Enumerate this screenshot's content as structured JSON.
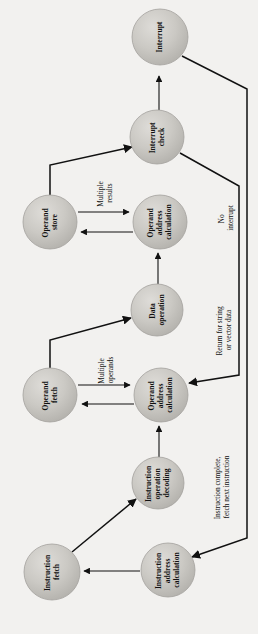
{
  "diagram": {
    "orientation": "rotated-90-ccw",
    "background_color": "#f2f1ef",
    "node_fill": "#c9c7c2",
    "node_stroke": "#9a9894",
    "line_color": "#111111",
    "nodes": [
      {
        "id": "interrupt",
        "label": "Interrupt",
        "cx": 160,
        "cy": 37,
        "r": 28
      },
      {
        "id": "interrupt-check",
        "label": "Interrupt\ncheck",
        "cx": 157,
        "cy": 137,
        "r": 27
      },
      {
        "id": "operand-store",
        "label": "Operand\nstore",
        "cx": 50,
        "cy": 222,
        "r": 27
      },
      {
        "id": "operand-addr-2",
        "label": "Operand\naddress\ncalculation",
        "cx": 160,
        "cy": 222,
        "r": 27
      },
      {
        "id": "data-operation",
        "label": "Data\noperation",
        "cx": 157,
        "cy": 310,
        "r": 26
      },
      {
        "id": "operand-fetch",
        "label": "Operand\nfetch",
        "cx": 50,
        "cy": 395,
        "r": 27
      },
      {
        "id": "operand-addr-1",
        "label": "Operand\naddress\ncalculation",
        "cx": 161,
        "cy": 395,
        "r": 27
      },
      {
        "id": "instr-decoding",
        "label": "Instruction\noperation\ndecoding",
        "cx": 158,
        "cy": 483,
        "r": 26
      },
      {
        "id": "instr-fetch",
        "label": "Instruction\nfetch",
        "cx": 52,
        "cy": 572,
        "r": 28
      },
      {
        "id": "instr-addr-calc",
        "label": "Instruction\naddress\ncalculation",
        "cx": 168,
        "cy": 570,
        "r": 27
      }
    ],
    "edge_labels": [
      {
        "id": "multiple-results",
        "text": "Multiple\nresults",
        "x": 105,
        "y": 193
      },
      {
        "id": "multiple-operands",
        "text": "Multiple\noperands",
        "x": 106,
        "y": 370
      },
      {
        "id": "no-interrupt",
        "text": "No\ninterrupt",
        "x": 226,
        "y": 218
      },
      {
        "id": "return-string",
        "text": "Return for string\nor vector data",
        "x": 224,
        "y": 330
      },
      {
        "id": "instruction-complete",
        "text": "Instruction complete,\nfetch next instruction",
        "x": 222,
        "y": 487
      }
    ]
  }
}
